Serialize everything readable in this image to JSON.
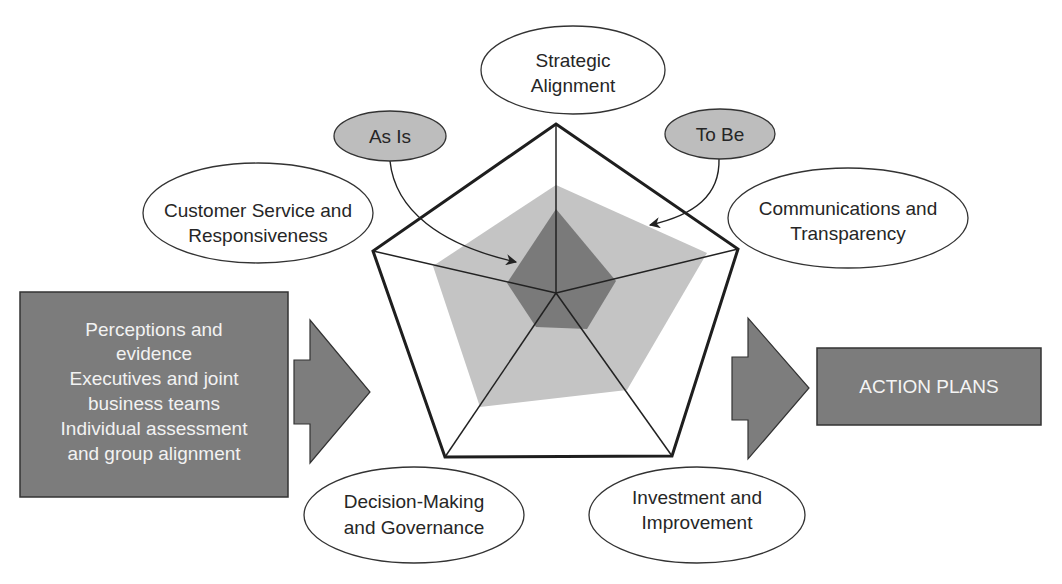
{
  "colors": {
    "background": "#ffffff",
    "dark_box": "#7c7c7c",
    "arrow_fill": "#7d7d7d",
    "to_be_fill": "#c4c4c4",
    "as_is_fill": "#7a7a7a",
    "tag_fill": "#bdbdbd",
    "outline": "#222222"
  },
  "pentagon": {
    "center": [
      556,
      293
    ],
    "vertices": [
      [
        556,
        124
      ],
      [
        738,
        249
      ],
      [
        672,
        456
      ],
      [
        445,
        457
      ],
      [
        373,
        251
      ]
    ]
  },
  "to_be_polygon": [
    [
      556,
      185
    ],
    [
      707,
      253
    ],
    [
      627,
      390
    ],
    [
      480,
      407
    ],
    [
      433,
      266
    ]
  ],
  "as_is_polygon": [
    [
      556,
      209
    ],
    [
      616,
      281
    ],
    [
      587,
      329
    ],
    [
      536,
      327
    ],
    [
      507,
      283
    ]
  ],
  "dimensions": [
    {
      "id": "strategic-alignment",
      "lines": [
        "Strategic",
        "Alignment"
      ],
      "cx": 573,
      "cy": 70,
      "rx": 92,
      "ry": 44
    },
    {
      "id": "communications-transparency",
      "lines": [
        "Communications and",
        "Transparency"
      ],
      "cx": 848,
      "cy": 218,
      "rx": 120,
      "ry": 50
    },
    {
      "id": "investment-improvement",
      "lines": [
        "Investment and",
        "Improvement"
      ],
      "cx": 697,
      "cy": 515,
      "rx": 108,
      "ry": 48
    },
    {
      "id": "decision-making-governance",
      "lines": [
        "Decision-Making",
        "and Governance"
      ],
      "cx": 414,
      "cy": 515,
      "rx": 110,
      "ry": 48
    },
    {
      "id": "customer-service-responsiveness",
      "lines": [
        "Customer Service and",
        "Responsiveness"
      ],
      "cx": 258,
      "cy": 213,
      "rx": 115,
      "ry": 50
    }
  ],
  "tags": {
    "as_is": {
      "label": "As Is",
      "cx": 390,
      "cy": 136,
      "rx": 56,
      "ry": 25
    },
    "to_be": {
      "label": "To Be",
      "cx": 720,
      "cy": 134,
      "rx": 55,
      "ry": 25
    }
  },
  "input_box": {
    "lines": [
      "Perceptions and",
      "evidence",
      "Executives and joint",
      "business teams",
      "Individual assessment",
      "and group alignment"
    ],
    "x": 20,
    "y": 292,
    "w": 268,
    "h": 205
  },
  "output_box": {
    "label": "ACTION PLANS",
    "x": 817,
    "y": 348,
    "w": 224,
    "h": 77
  }
}
